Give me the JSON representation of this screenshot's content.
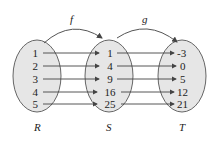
{
  "diagram": {
    "sets": [
      {
        "name": "R",
        "elements": [
          "1",
          "2",
          "3",
          "4",
          "5"
        ]
      },
      {
        "name": "S",
        "elements": [
          "1",
          "4",
          "9",
          "16",
          "25"
        ]
      },
      {
        "name": "T",
        "elements": [
          "-3",
          "0",
          "5",
          "12",
          "21"
        ]
      }
    ],
    "functions": [
      {
        "name": "f",
        "from": "R",
        "to": "S"
      },
      {
        "name": "g",
        "from": "S",
        "to": "T"
      }
    ],
    "colors": {
      "set_fill": "#e6e6e6",
      "stroke": "#555555"
    }
  }
}
